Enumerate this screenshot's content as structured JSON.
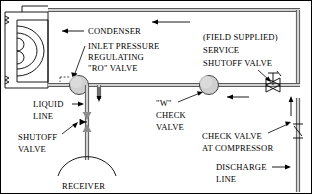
{
  "diagram": {
    "labels": {
      "condenser": "CONDENSER",
      "inlet_pressure_line1": "INLET PRESSURE",
      "inlet_pressure_line2": "REGULATING",
      "inlet_pressure_line3": "\"RO\" VALVE",
      "field_supplied": "(FIELD SUPPLIED)",
      "service": "SERVICE",
      "shutoff_valve_top": "SHUTOFF VALVE",
      "liquid_line1": "LIQUID",
      "liquid_line2": "LINE",
      "shutoff_line1": "SHUTOFF",
      "shutoff_line2": "VALVE",
      "w_check_line1": "\"W\"",
      "w_check_line2": "CHECK",
      "w_check_line3": "VALVE",
      "check_compressor_line1": "CHECK VALVE",
      "check_compressor_line2": "AT COMPRESSOR",
      "discharge_line1": "DISCHARGE",
      "discharge_line2": "LINE",
      "receiver": "RECEIVER"
    },
    "colors": {
      "pipe_outline": "#5a5a5a",
      "pipe_fill": "#d2d2d2",
      "valve_fill": "#cfcfcf",
      "line": "#000000",
      "background": "#ffffff"
    },
    "components": [
      {
        "name": "condenser",
        "type": "coil-box"
      },
      {
        "name": "inlet-pressure-regulating-ro-valve",
        "type": "circle-valve"
      },
      {
        "name": "w-check-valve",
        "type": "circle-valve"
      },
      {
        "name": "service-shutoff-valve",
        "type": "globe-valve"
      },
      {
        "name": "liquid-line-shutoff-valve",
        "type": "angle-valve"
      },
      {
        "name": "check-valve-at-compressor",
        "type": "swing-check-valve"
      },
      {
        "name": "receiver",
        "type": "dome"
      }
    ],
    "flow_arrows": [
      {
        "name": "top-line-flow",
        "direction": "left"
      },
      {
        "name": "condenser-inlet-flow",
        "direction": "left"
      },
      {
        "name": "liquid-line-down-flow",
        "direction": "down"
      },
      {
        "name": "liquid-line-up-flow",
        "direction": "up"
      },
      {
        "name": "discharge-line-flow",
        "direction": "right"
      },
      {
        "name": "right-riser-flow",
        "direction": "up"
      },
      {
        "name": "ro-valve-outlet-flow",
        "direction": "down"
      },
      {
        "name": "service-valve-inlet-flow",
        "direction": "left"
      }
    ]
  }
}
